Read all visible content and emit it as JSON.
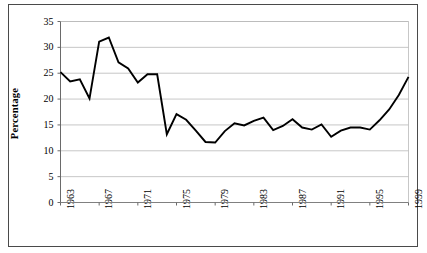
{
  "chart_data": {
    "type": "line",
    "title": "",
    "subtitle": "",
    "xlabel": "",
    "ylabel": "Percentage",
    "ylim": [
      0,
      35
    ],
    "ytick_step": 5,
    "yticks": [
      "0",
      "5",
      "10",
      "15",
      "20",
      "25",
      "30",
      "35"
    ],
    "xticks": [
      "1963",
      "1967",
      "1971",
      "1975",
      "1979",
      "1983",
      "1987",
      "1991",
      "1995",
      "1999"
    ],
    "xtick_step": 4,
    "xlim": [
      1963,
      1999
    ],
    "grid": "horizontal",
    "legend": "none",
    "line_color": "#000000",
    "grid_color": "#b9b9b9",
    "axis_color": "#808080",
    "frame_color": "#4a4a4a",
    "background": "#ffffff",
    "x": [
      1963,
      1964,
      1965,
      1966,
      1967,
      1968,
      1969,
      1970,
      1971,
      1972,
      1973,
      1974,
      1975,
      1976,
      1977,
      1978,
      1979,
      1980,
      1981,
      1982,
      1983,
      1984,
      1985,
      1986,
      1987,
      1988,
      1989,
      1990,
      1991,
      1992,
      1993,
      1994,
      1995,
      1996,
      1997,
      1998,
      1999
    ],
    "series": [
      {
        "name": "Percentage",
        "values": [
          25.2,
          23.4,
          23.8,
          20.1,
          31.1,
          31.9,
          27.1,
          25.9,
          23.2,
          24.8,
          24.8,
          13.2,
          17.1,
          16.0,
          13.9,
          11.7,
          11.6,
          13.8,
          15.3,
          14.9,
          15.8,
          16.4,
          14.0,
          14.8,
          16.1,
          14.5,
          14.1,
          15.1,
          12.7,
          13.9,
          14.5,
          14.5,
          14.1,
          15.9,
          18.0,
          20.8,
          24.3
        ]
      }
    ]
  },
  "figure": {
    "y_axis_title": "Percentage"
  }
}
